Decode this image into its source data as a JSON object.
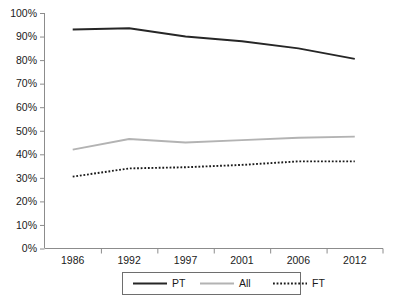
{
  "chart_data": {
    "type": "line",
    "title": "",
    "xlabel": "",
    "ylabel": "",
    "categories": [
      "1986",
      "1992",
      "1997",
      "2001",
      "2006",
      "2012"
    ],
    "ylim": [
      0,
      100
    ],
    "ytick_labels": [
      "0%",
      "10%",
      "20%",
      "30%",
      "40%",
      "50%",
      "60%",
      "70%",
      "80%",
      "90%",
      "100%"
    ],
    "ytick_values": [
      0,
      10,
      20,
      30,
      40,
      50,
      60,
      70,
      80,
      90,
      100
    ],
    "grid": false,
    "legend_position": "bottom",
    "series": [
      {
        "name": "PT",
        "style": "solid",
        "color": "#262626",
        "width": 1.9,
        "values": [
          93,
          93.5,
          90,
          88,
          85,
          80.5
        ]
      },
      {
        "name": "All",
        "style": "solid",
        "color": "#b3b3b3",
        "width": 1.9,
        "values": [
          42,
          46.5,
          45,
          46,
          47,
          47.5
        ]
      },
      {
        "name": "FT",
        "style": "dotted",
        "color": "#1a1a1a",
        "width": 1.9,
        "values": [
          30.5,
          34,
          34.5,
          35.5,
          37,
          37
        ]
      }
    ]
  },
  "axes": {
    "axis_color": "#8c8c8c",
    "legend_border_color": "#6e6e6e"
  },
  "legend": {
    "items": [
      {
        "label": "PT"
      },
      {
        "label": "All"
      },
      {
        "label": "FT"
      }
    ]
  }
}
